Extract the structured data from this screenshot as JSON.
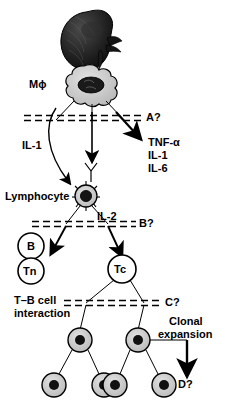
{
  "figure": {
    "title_visible": false,
    "type": "biological-pathway-diagram",
    "colors": {
      "stroke": "#000000",
      "background": "#ffffff",
      "cell_fill_grey": "#c9c9c9",
      "cell_fill_light": "#d8d8d8",
      "nucleus_dark": "#111111",
      "organ_dark": "#1a1a1a"
    }
  },
  "organ": {
    "name": "kidney-illustration",
    "description": "dark shaded kidney with hilum vessels"
  },
  "labels": {
    "macrophage": "Mϕ",
    "barrier_a": "A?",
    "il1_left": "IL-1",
    "cytokines": [
      "TNF-α",
      "IL-1",
      "IL-6"
    ],
    "lymphocyte": "Lymphocyte",
    "il2": "IL-2",
    "barrier_b": "B?",
    "cell_b": "B",
    "cell_tn": "Tn",
    "cell_tc": "Tc",
    "tb_interaction_line1": "T–B cell",
    "tb_interaction_line2": "interaction",
    "barrier_c": "C?",
    "clonal_line1": "Clonal",
    "clonal_line2": "expansion",
    "barrier_d": "D?"
  },
  "nodes": {
    "macrophage_cell": {
      "label": "Mϕ",
      "shape": "amoeboid",
      "x": 84,
      "y": 85
    },
    "lymphocyte_cell": {
      "label": "Lymphocyte",
      "shape": "spiked-circle",
      "x": 86,
      "y": 196
    },
    "b_cell": {
      "label": "B",
      "shape": "circle-open",
      "x": 43,
      "y": 243
    },
    "tn_cell": {
      "label": "Tn",
      "shape": "circle-open",
      "x": 43,
      "y": 268
    },
    "tc_cell": {
      "label": "Tc",
      "shape": "circle-open",
      "x": 113,
      "y": 268
    },
    "clone_parent_left": {
      "label": "",
      "shape": "circle-filled",
      "x": 78,
      "y": 340
    },
    "clone_parent_right": {
      "label": "",
      "shape": "circle-filled",
      "x": 136,
      "y": 340
    },
    "clone_child_1": {
      "label": "",
      "shape": "circle-filled",
      "x": 56,
      "y": 385
    },
    "clone_child_2": {
      "label": "",
      "shape": "circle-filled",
      "x": 97,
      "y": 385
    },
    "clone_child_3": {
      "label": "",
      "shape": "circle-filled",
      "x": 123,
      "y": 385
    },
    "clone_child_4": {
      "label": "",
      "shape": "circle-filled",
      "x": 162,
      "y": 385
    }
  },
  "barriers": [
    {
      "name": "barrier-a",
      "label": "A?",
      "y": 118
    },
    {
      "name": "barrier-b",
      "label": "B?",
      "y": 224
    },
    {
      "name": "barrier-c",
      "label": "C?",
      "y": 303
    }
  ],
  "arrows": [
    {
      "name": "macrophage-to-il1-arrow",
      "from": "macrophage",
      "to": "lymphocyte",
      "label": "IL-1"
    },
    {
      "name": "macrophage-to-cytokines-arrow",
      "from": "macrophage",
      "to": "cytokines",
      "label": "A?"
    },
    {
      "name": "macrophage-down-arrow",
      "from": "macrophage",
      "to": "antibody-y",
      "label": ""
    },
    {
      "name": "lymphocyte-to-tn-arrow",
      "from": "lymphocyte",
      "to": "Tn",
      "label": "IL-2"
    },
    {
      "name": "lymphocyte-to-tc-arrow",
      "from": "lymphocyte",
      "to": "Tc",
      "label": "IL-2"
    },
    {
      "name": "clonal-expansion-arrow",
      "from": "clone_parent_right",
      "to": "D?",
      "label": "Clonal expansion"
    }
  ]
}
